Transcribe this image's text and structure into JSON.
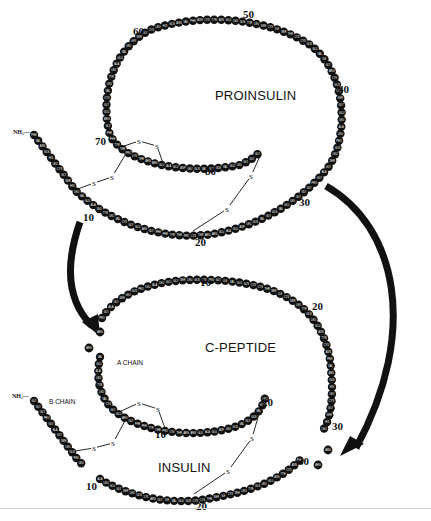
{
  "figure": {
    "colors": {
      "bead": "#111111",
      "bead_text": "#ffffff",
      "line": "#111111",
      "background": "#ffffff"
    },
    "proinsulin": {
      "title": "PROINSULIN",
      "nh2": "NH₂—",
      "numbers": [
        {
          "text": "60",
          "x": 133,
          "y": 32
        },
        {
          "text": "50",
          "x": 243,
          "y": 15
        },
        {
          "text": "40",
          "x": 338,
          "y": 90
        },
        {
          "text": "70",
          "x": 95,
          "y": 142
        },
        {
          "text": "80",
          "x": 205,
          "y": 172
        },
        {
          "text": "30",
          "x": 299,
          "y": 203
        },
        {
          "text": "10",
          "x": 83,
          "y": 218
        },
        {
          "text": "20",
          "x": 195,
          "y": 243
        }
      ],
      "disulfide_s": [
        {
          "x": 139,
          "y": 141
        },
        {
          "x": 157,
          "y": 146
        },
        {
          "x": 112,
          "y": 177
        },
        {
          "x": 94,
          "y": 183
        },
        {
          "x": 251,
          "y": 176
        },
        {
          "x": 227,
          "y": 209
        }
      ]
    },
    "conversion": {
      "c_peptide_title": "C-PEPTIDE",
      "insulin_title": "INSULIN",
      "a_chain_label": "A CHAIN",
      "b_chain_label": "B CHAIN",
      "nh2": "NH₂—",
      "numbers": [
        {
          "text": "10",
          "x": 200,
          "y": 283
        },
        {
          "text": "20",
          "x": 312,
          "y": 307
        },
        {
          "text": "20",
          "x": 262,
          "y": 403
        },
        {
          "text": "30",
          "x": 332,
          "y": 427
        },
        {
          "text": "30",
          "x": 298,
          "y": 462
        },
        {
          "text": "10",
          "x": 155,
          "y": 435
        },
        {
          "text": "10",
          "x": 86,
          "y": 487
        },
        {
          "text": "20",
          "x": 196,
          "y": 507
        }
      ],
      "disulfide_s": [
        {
          "x": 139,
          "y": 403
        },
        {
          "x": 158,
          "y": 409
        },
        {
          "x": 113,
          "y": 443
        },
        {
          "x": 94,
          "y": 448
        },
        {
          "x": 252,
          "y": 438
        },
        {
          "x": 228,
          "y": 471
        }
      ],
      "free_residues": [
        {
          "code": "ARG",
          "x": 100,
          "y": 332
        },
        {
          "code": "ARG",
          "x": 89,
          "y": 348
        },
        {
          "code": "ARG",
          "x": 328,
          "y": 450
        },
        {
          "code": "ARG",
          "x": 318,
          "y": 465
        }
      ]
    }
  }
}
